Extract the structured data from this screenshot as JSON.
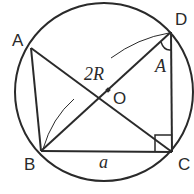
{
  "diagram": {
    "circle": {
      "center": [
        104,
        92
      ],
      "radius": 89,
      "center_label": "O"
    },
    "points": {
      "A": {
        "label": "A",
        "xy": [
          31,
          48
        ]
      },
      "B": {
        "label": "B",
        "xy": [
          41,
          151
        ]
      },
      "C": {
        "label": "C",
        "xy": [
          172,
          152
        ]
      },
      "D": {
        "label": "D",
        "xy": [
          171,
          32
        ]
      },
      "O": {
        "label": "O",
        "xy": [
          106,
          91
        ]
      }
    },
    "segments": [
      "AB",
      "AC",
      "BD",
      "BC",
      "DC"
    ],
    "annotations": {
      "diameter_label": "2R",
      "angle_label": "A",
      "side_label": "a",
      "right_angle_at": "C"
    },
    "colors": {
      "ink": "#2a2a2a",
      "background": "#ffffff"
    }
  }
}
